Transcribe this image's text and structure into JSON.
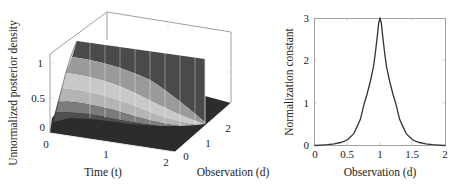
{
  "chart_data": [
    {
      "type": "surface",
      "title": "",
      "xlabel": "Time (t)",
      "ylabel": "Observation (d)",
      "zlabel": "Unnormalized posterior density",
      "x_ticks": [
        "0",
        "1",
        "2"
      ],
      "y_ticks": [
        "0",
        "1",
        "2"
      ],
      "z_ticks": [
        "0",
        "0.5",
        "1"
      ],
      "xlim": [
        0,
        2
      ],
      "ylim": [
        0,
        2.5
      ],
      "zlim": [
        0,
        1.1
      ],
      "colormap": "grayscale bands",
      "description": "Ridge surface of height ~1 at low d, decaying in diagonal grayscale bands toward higher t"
    },
    {
      "type": "line",
      "title": "",
      "xlabel": "Observation (d)",
      "ylabel": "Normalization constant",
      "x_ticks": [
        "0",
        "0.5",
        "1",
        "1.5",
        "2"
      ],
      "y_ticks": [
        "0",
        "1",
        "2",
        "3"
      ],
      "xlim": [
        0,
        2
      ],
      "ylim": [
        0,
        3
      ],
      "grid": false,
      "series": [
        {
          "name": "normalization",
          "x": [
            0,
            0.1,
            0.2,
            0.3,
            0.4,
            0.5,
            0.6,
            0.7,
            0.76,
            0.8,
            0.85,
            0.9,
            0.93,
            0.96,
            0.98,
            1.0,
            1.02,
            1.04,
            1.07,
            1.1,
            1.15,
            1.2,
            1.24,
            1.3,
            1.4,
            1.5,
            1.6,
            1.7,
            1.8,
            1.9,
            2.0
          ],
          "y": [
            0.0,
            0.01,
            0.02,
            0.04,
            0.07,
            0.13,
            0.28,
            0.62,
            1.0,
            1.2,
            1.5,
            1.85,
            2.2,
            2.6,
            2.9,
            3.0,
            2.9,
            2.6,
            2.2,
            1.85,
            1.5,
            1.2,
            1.0,
            0.62,
            0.28,
            0.13,
            0.07,
            0.04,
            0.02,
            0.01,
            0.0
          ]
        }
      ]
    }
  ],
  "left_plot": {
    "z_label": "Unnormalized posterior density",
    "x_label": "Time (t)",
    "y_label": "Observation (d)",
    "z_ticks": [
      "1",
      "0.5",
      "0"
    ],
    "x_ticks": [
      "0",
      "1",
      "2"
    ],
    "y_ticks": [
      "0",
      "1",
      "2"
    ]
  },
  "right_plot": {
    "y_label": "Normalization constant",
    "x_label": "Observation (d)",
    "y_ticks": [
      "3",
      "2",
      "1",
      "0"
    ],
    "x_ticks": [
      "0",
      "0.5",
      "1",
      "1.5",
      "2"
    ],
    "line_color": "#333333"
  }
}
